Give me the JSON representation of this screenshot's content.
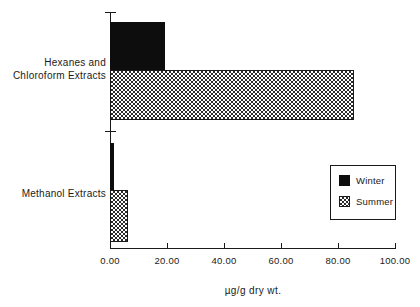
{
  "chart_data": {
    "type": "bar",
    "orientation": "horizontal",
    "title": "",
    "subtitle": "",
    "xlabel": "µg/g  dry  wt.",
    "ylabel": "",
    "categories": [
      "Hexanes and\nChloroform Extracts",
      "Methanol Extracts"
    ],
    "series": [
      {
        "name": "Winter",
        "values": [
          19.3,
          1.5
        ],
        "fill": "solid-black",
        "color": "#0d0d0d"
      },
      {
        "name": "Summer",
        "values": [
          85.5,
          6.3
        ],
        "fill": "checker-hatch",
        "color": "#2b2b2b"
      }
    ],
    "xlim": [
      0,
      100
    ],
    "xticks": [
      0,
      20,
      40,
      60,
      80,
      100
    ],
    "xtick_labels": [
      "0.00",
      "20.00",
      "40.00",
      "60.00",
      "80.00",
      "100.00"
    ],
    "grid": false,
    "legend_position": "inside-right"
  },
  "axis": {
    "x_title": "µg/g  dry  wt.",
    "tick_labels": [
      "0.00",
      "20.00",
      "40.00",
      "60.00",
      "80.00",
      "100.00"
    ]
  },
  "categories": [
    {
      "label": "Hexanes and\nChloroform Extracts"
    },
    {
      "label": "Methanol Extracts"
    }
  ],
  "legend": {
    "entries": [
      {
        "label": "Winter"
      },
      {
        "label": "Summer"
      }
    ]
  }
}
